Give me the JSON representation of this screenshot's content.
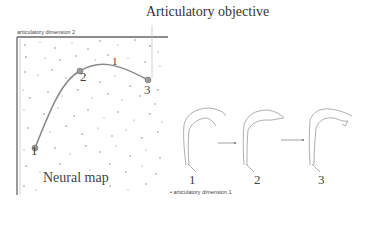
{
  "title": "Articulatory objective",
  "neural_map": {
    "label": "Neural map",
    "axis_x_label": "articulatory dimension 1",
    "axis_y_label": "articulatory dimension 2",
    "trajectory_points": [
      {
        "label": "1",
        "x": 35,
        "y": 148
      },
      {
        "label": "2",
        "x": 80,
        "y": 71
      },
      {
        "label": "3",
        "x": 148,
        "y": 80
      }
    ],
    "curve_label": "1",
    "curve_color": "#888888",
    "dot_color": "#777777"
  },
  "vocal_tract_shapes": [
    {
      "label": "1"
    },
    {
      "label": "2"
    },
    {
      "label": "3"
    }
  ]
}
